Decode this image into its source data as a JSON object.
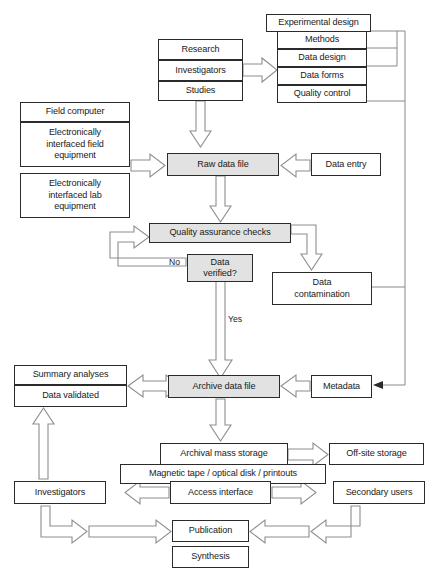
{
  "diagram": {
    "type": "flowchart",
    "colors": {
      "shaded_fill": "#e2e2e2",
      "node_border": "#2b2b2b",
      "arrow_stroke": "#8d8d8d",
      "arrow_fill": "#ffffff",
      "connector_line": "#7d7d7d",
      "background": "#ffffff"
    }
  },
  "nodes": {
    "research": "Research",
    "investigators_top": "Investigators",
    "studies": "Studies",
    "experimental_design": "Experimental design",
    "methods": "Methods",
    "data_design": "Data design",
    "data_forms": "Data forms",
    "quality_control": "Quality control",
    "field_computer": "Field computer",
    "field_equipment": "Electronically\ninterfaced field\nequipment",
    "lab_equipment": "Electronically\ninterfaced lab\nequipment",
    "raw_data_file": "Raw data file",
    "data_entry": "Data entry",
    "quality_assurance_checks": "Quality assurance  checks",
    "data_verified": "Data\nverified?",
    "data_contamination": "Data\ncontamination",
    "summary_analyses": "Summary analyses",
    "data_validated": "Data validated",
    "archive_data_file": "Archive data file",
    "metadata": "Metadata",
    "archival_mass_storage": "Archival mass storage",
    "offsite_storage": "Off-site storage",
    "magnetic_tape": "Magnetic tape / optical disk / printouts",
    "access_interface": "Access interface",
    "investigators_bottom": "Investigators",
    "secondary_users": "Secondary users",
    "publication": "Publication",
    "synthesis": "Synthesis"
  },
  "edge_labels": {
    "no": "No",
    "yes": "Yes"
  },
  "caption": {
    "text": ""
  }
}
